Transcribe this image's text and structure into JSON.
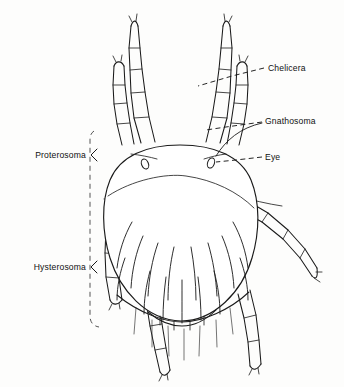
{
  "figure": {
    "view": "dorsal",
    "style": "line drawing",
    "background_color": "#fdfdfc",
    "ink_color": "#1a1a1a",
    "label_color": "#111111"
  },
  "labels": {
    "chelicera": {
      "text": "Chelicera",
      "side": "right",
      "text_x": 268,
      "text_y": 71,
      "leader_kind": "dashed",
      "leader": "M 264 68 L 232 76 L 198 86"
    },
    "gnathosoma": {
      "text": "Gnathosoma",
      "side": "right",
      "text_x": 265,
      "text_y": 124,
      "leader_kind": "dashed",
      "leader": "M 262 122 L 226 127 L 206 130",
      "leader_extra": "M 262 123 C 240 128 226 140 216 156"
    },
    "eye": {
      "text": "Eye",
      "side": "right",
      "text_x": 265,
      "text_y": 160,
      "leader_kind": "dashed",
      "leader": "M 262 157 L 236 160 L 216 162"
    },
    "proterosoma": {
      "text": "Proterosoma",
      "side": "left",
      "text_x": 86,
      "text_y": 155,
      "brace_kind": "angle",
      "brace": "M 97 149 L 91 155 L 97 161"
    },
    "hysterosoma": {
      "text": "Hysterosoma",
      "side": "left",
      "text_x": 86,
      "text_y": 267,
      "brace_kind": "angle",
      "brace": "M 97 261 L 91 267 L 97 273"
    }
  },
  "bracket": {
    "name": "region-bracket",
    "kind": "dashed-vertical",
    "path": "M 94 131 C 91 133 90 136 90 140 L 90 316 C 90 322 93 326 99 327"
  },
  "anatomy": {
    "idiosoma": {
      "name": "idiosoma-outline",
      "path": "M 180 145 C 146 145 120 156 110 180 C 101 202 102 232 110 258 C 120 290 146 320 181 321 C 214 321 242 292 252 258 C 260 231 260 202 251 180 C 241 156 214 145 180 145 Z"
    },
    "proterosoma_line": {
      "name": "proterosoma-hysterosoma-suture",
      "path": "M 108 196 C 132 180 166 173 186 176 C 214 180 238 192 254 208"
    },
    "posterior_fold": {
      "name": "posterior-fold",
      "path": "M 117 295 C 140 314 166 322 182 322 C 202 322 230 310 249 292"
    },
    "ventral_plate": {
      "name": "posterior-plate",
      "path": "M 148 312 C 160 322 172 326 182 326 C 194 326 206 320 216 310"
    },
    "eyes": [
      {
        "name": "eye-left",
        "cx": 145,
        "cy": 164,
        "rx": 3.4,
        "ry": 5.2,
        "rot": -22
      },
      {
        "name": "eye-right",
        "cx": 211,
        "cy": 163,
        "rx": 3.4,
        "ry": 5.2,
        "rot": 20
      }
    ],
    "eye_setae": [
      {
        "name": "seta-eye-left",
        "path": "M 131 154 C 140 155 150 157 157 159"
      },
      {
        "name": "seta-eye-right",
        "path": "M 226 154 C 218 155 210 157 204 159"
      }
    ]
  },
  "gnathosoma_detail": {
    "hypostome": {
      "name": "hypostome",
      "path": "M 180 89 L 170 126 C 173 131 188 131 191 126 Z"
    },
    "hypostome_base": {
      "name": "hypostome-base",
      "path": "M 167 124 C 170 136 192 136 195 124"
    },
    "chelicera_left": {
      "name": "chelicera-left",
      "path": "M 172 84 C 166 87 163 96 164 106 C 165 113 168 118 172 120"
    },
    "chelicera_right": {
      "name": "chelicera-right",
      "path": "M 189 84 C 195 87 198 96 197 106 C 196 113 193 118 189 120"
    },
    "cheliceral_tip_left": {
      "name": "cheliceral-tip-left",
      "path": "M 169 82 C 173 80 177 82 179 86"
    },
    "cheliceral_tip_right": {
      "name": "cheliceral-tip-right",
      "path": "M 192 82 C 188 80 184 82 182 86"
    },
    "midline": {
      "name": "gnathosoma-midline",
      "path": "M 180 90 L 180 128"
    },
    "subcapitulum": {
      "name": "subcapitulum",
      "path": "M 160 118 C 166 134 195 134 201 118"
    },
    "collar": {
      "name": "gnathosoma-collar",
      "path": "M 152 113 C 164 107 198 107 210 113"
    },
    "basis_left": {
      "name": "basis-capituli-left",
      "path": "M 164 96 C 160 104 159 116 161 124"
    },
    "basis_right": {
      "name": "basis-capituli-right",
      "path": "M 197 96 C 201 104 202 116 200 124"
    }
  },
  "appendages": {
    "leg_1_left": {
      "name": "leg-1-left",
      "outer": "M 141 143 L 134 118 L 131 93 L 130 70 L 129 48 L 131 26",
      "inner": "M 155 142 L 149 117 L 145 92 L 142 69 L 140 48 L 138 26",
      "joints": [
        "M 134 118 L 149 117",
        "M 131 93 L 145 92",
        "M 130 70 L 142 69",
        "M 129 48 L 140 48"
      ],
      "tip": "M 131 26 C 133 20 136 19 138 26",
      "tip_setae": "M 132 22 L 129 16 M 136 21 L 137 14"
    },
    "palp_left": {
      "name": "palp-left",
      "outer": "M 122 145 L 117 124 L 114 104 L 113 85 L 114 66",
      "inner": "M 134 144 L 130 123 L 127 103 L 125 85 L 124 66",
      "joints": [
        "M 117 124 L 130 123",
        "M 114 104 L 127 103",
        "M 113 85 L 125 85"
      ],
      "tip": "M 114 66 C 116 61 121 60 124 66",
      "tip_setae": "M 116 62 L 113 56 M 121 61 L 122 55"
    },
    "leg_1_right": {
      "name": "leg-1-right",
      "outer": "M 220 143 L 227 118 L 230 93 L 231 70 L 232 48 L 230 26",
      "inner": "M 206 142 L 212 117 L 216 92 L 219 69 L 221 48 L 223 26",
      "joints": [
        "M 227 118 L 212 117",
        "M 230 93 L 216 92",
        "M 231 70 L 219 69",
        "M 232 48 L 221 48"
      ],
      "tip": "M 230 26 C 228 20 225 19 223 26",
      "tip_setae": "M 229 22 L 232 16 M 225 21 L 224 14"
    },
    "palp_right": {
      "name": "palp-right",
      "outer": "M 239 145 L 244 124 L 247 104 L 248 85 L 247 66",
      "inner": "M 227 144 L 231 123 L 234 103 L 236 85 L 237 66",
      "joints": [
        "M 244 124 L 231 123",
        "M 247 104 L 234 103",
        "M 248 85 L 236 85"
      ],
      "tip": "M 247 66 C 245 61 240 60 237 66",
      "tip_setae": "M 245 62 L 248 56 M 240 61 L 239 55"
    },
    "leg_3_right": {
      "name": "leg-3-right",
      "outer": "M 240 210 L 262 222 L 283 239 L 300 258 L 312 276",
      "inner": "M 246 200 L 268 213 L 288 230 L 305 249 L 317 268",
      "joints": [
        "M 262 222 L 268 213",
        "M 283 239 L 288 230",
        "M 300 258 L 305 249"
      ],
      "tip": "M 312 276 C 316 280 318 278 317 268",
      "tip_setae": "M 314 278 L 320 282 M 316 272 L 322 272",
      "dorsal_seta": "M 236 196 C 252 200 268 204 282 206"
    },
    "leg_2_right": {
      "name": "leg-2-right",
      "outer": "M 238 294 L 244 318 L 248 342 L 250 366",
      "inner": "M 250 290 L 256 315 L 259 340 L 261 364",
      "joints": [
        "M 244 318 L 256 315",
        "M 248 342 L 259 340"
      ],
      "tip": "M 250 366 C 253 371 257 370 261 364",
      "tip_setae": "M 252 369 L 249 375 M 258 368 L 259 374"
    },
    "leg_3_left": {
      "name": "leg-3-left",
      "outer": "M 109 203 L 106 228 L 105 253 L 106 277 L 110 300",
      "inner": "M 121 206 L 119 230 L 118 254 L 119 278 L 122 300",
      "joints": [
        "M 106 228 L 119 230",
        "M 105 253 L 118 254",
        "M 106 277 L 119 278"
      ],
      "tip": "M 110 300 C 113 306 118 305 122 300",
      "tip_setae": "M 112 304 L 109 310 M 119 303 L 120 309",
      "dorsal_seta": "M 104 199 L 122 200"
    },
    "leg_4_left": {
      "name": "leg-4-left",
      "outer": "M 143 277 L 146 301 L 150 326 L 155 350 L 160 372",
      "inner": "M 155 274 L 158 299 L 162 324 L 166 348 L 170 370",
      "joints": [
        "M 146 301 L 158 299",
        "M 150 326 L 162 324",
        "M 155 350 L 166 348"
      ],
      "tip": "M 160 372 C 163 377 167 376 170 370",
      "tip_setae": "M 162 375 L 159 381 M 167 374 L 168 380",
      "dorsal_seta": "M 140 272 L 157 271"
    }
  },
  "dorsal_setae": [
    {
      "name": "seta-d1",
      "path": "M 143 236 C 136 252 132 270 131 288"
    },
    {
      "name": "seta-d2",
      "path": "M 158 243 C 152 260 149 278 148 296"
    },
    {
      "name": "seta-d3",
      "path": "M 174 247 C 170 264 168 282 168 300"
    },
    {
      "name": "seta-d4",
      "path": "M 191 247 C 194 264 196 282 196 300"
    },
    {
      "name": "seta-d5",
      "path": "M 208 243 C 213 260 216 278 217 296"
    },
    {
      "name": "seta-d6",
      "path": "M 222 236 C 229 252 233 270 234 288"
    },
    {
      "name": "seta-d7",
      "path": "M 132 222 C 124 236 119 252 117 268"
    },
    {
      "name": "seta-d8",
      "path": "M 233 222 C 241 236 246 252 248 268"
    },
    {
      "name": "seta-d9",
      "path": "M 150 271 C 146 286 144 300 144 314"
    },
    {
      "name": "seta-d10",
      "path": "M 166 277 C 164 292 163 306 163 320"
    },
    {
      "name": "seta-d11",
      "path": "M 182 280 C 182 295 182 309 182 323"
    },
    {
      "name": "seta-d12",
      "path": "M 198 277 C 200 292 201 306 201 320"
    },
    {
      "name": "seta-d13",
      "path": "M 214 271 C 218 286 220 300 220 314"
    },
    {
      "name": "seta-d14",
      "path": "M 125 258 C 120 272 117 286 117 300"
    },
    {
      "name": "seta-d15",
      "path": "M 240 258 C 245 272 248 286 248 300"
    }
  ],
  "ventral_setae": [
    {
      "name": "seta-v1",
      "path": "M 152 320 L 152 347"
    },
    {
      "name": "seta-v2",
      "path": "M 168 326 L 169 356"
    },
    {
      "name": "seta-v3",
      "path": "M 184 329 L 184 360"
    },
    {
      "name": "seta-v4",
      "path": "M 200 326 L 199 356"
    },
    {
      "name": "seta-v5",
      "path": "M 216 320 L 217 347"
    },
    {
      "name": "seta-v6",
      "path": "M 136 308 L 134 334"
    },
    {
      "name": "seta-v7",
      "path": "M 230 308 L 233 334"
    }
  ],
  "plate_ticks": [
    {
      "name": "plate-tick-1",
      "path": "M 160 316 L 160 325"
    },
    {
      "name": "plate-tick-2",
      "path": "M 174 322 L 174 330"
    },
    {
      "name": "plate-tick-3",
      "path": "M 190 322 L 190 330"
    },
    {
      "name": "plate-tick-4",
      "path": "M 204 316 L 204 325"
    }
  ]
}
